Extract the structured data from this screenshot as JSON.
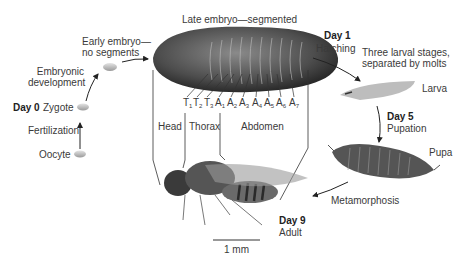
{
  "stages": {
    "oocyte": "Oocyte",
    "fertilization": "Fertilization",
    "day0": "Day 0",
    "zygote": "Zygote",
    "embryonic_development": [
      "Embryonic",
      "development"
    ],
    "early_embryo": [
      "Early embryo—",
      "no segments"
    ],
    "late_embryo": "Late embryo—segmented",
    "day1": "Day 1",
    "hatching": "Hatching",
    "larval_stages": [
      "Three larval stages,",
      "separated by molts"
    ],
    "larva": "Larva",
    "day5": "Day 5",
    "pupation": "Pupation",
    "pupa": "Pupa",
    "metamorphosis": "Metamorphosis",
    "day9": "Day 9",
    "adult": "Adult"
  },
  "segments": [
    {
      "letter": "T",
      "num": "1"
    },
    {
      "letter": "T",
      "num": "2"
    },
    {
      "letter": "T",
      "num": "3"
    },
    {
      "letter": "A",
      "num": "1"
    },
    {
      "letter": "A",
      "num": "2"
    },
    {
      "letter": "A",
      "num": "3"
    },
    {
      "letter": "A",
      "num": "4"
    },
    {
      "letter": "A",
      "num": "5"
    },
    {
      "letter": "A",
      "num": "6"
    },
    {
      "letter": "A",
      "num": "7"
    }
  ],
  "regions": {
    "head": "Head",
    "thorax": "Thorax",
    "abdomen": "Abdomen"
  },
  "scale_bar": "1 mm"
}
